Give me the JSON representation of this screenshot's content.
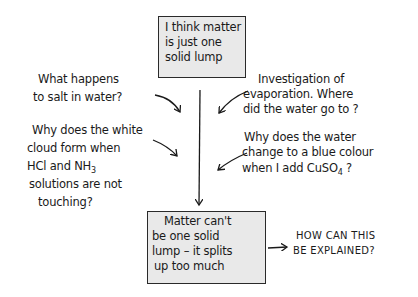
{
  "diagram": {
    "start_box": {
      "lines": [
        "I think matter",
        "is just one",
        "solid lump"
      ]
    },
    "evidence_left": [
      {
        "lines": [
          "What happens",
          "to salt in water?"
        ]
      },
      {
        "lines": [
          "Why does the white",
          "cloud form when",
          "HCl and NH3",
          "solutions are not",
          "touching?"
        ]
      }
    ],
    "evidence_right": [
      {
        "lines": [
          "Investigation of",
          "evaporation.  Where",
          "did the water go to ?"
        ]
      },
      {
        "lines": [
          "Why does the water",
          "change to a blue colour",
          "when I add CuSO4 ?"
        ]
      }
    ],
    "conclusion_box": {
      "lines": [
        "Matter can't",
        "be one solid",
        "lump – it splits",
        "up too much"
      ]
    },
    "question": {
      "lines": [
        "HOW CAN THIS",
        "BE EXPLAINED?"
      ]
    },
    "colors": {
      "box_fill": "#e9e9e9",
      "ink": "#1a1a1a"
    }
  }
}
